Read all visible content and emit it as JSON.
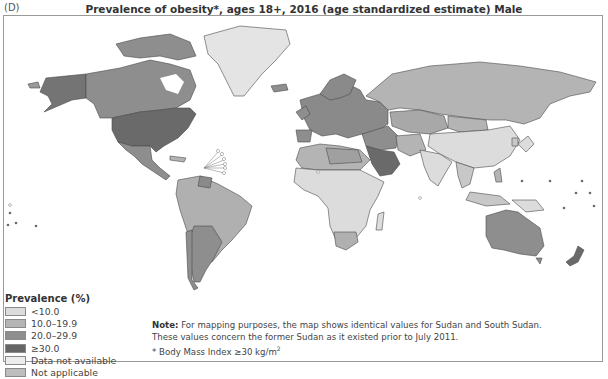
{
  "panel_label": "(D)",
  "title": "Prevalence of obesity*, ages 18+, 2016 (age standardized estimate) Male",
  "legend": {
    "title": "Prevalence (%)",
    "items": [
      {
        "label": "<10.0",
        "color": "#dcdcdc"
      },
      {
        "label": "10.0–19.9",
        "color": "#b4b4b4"
      },
      {
        "label": "20.0–29.9",
        "color": "#8e8e8e"
      },
      {
        "label": "≥30.0",
        "color": "#666666"
      },
      {
        "label": "Data not available",
        "color": "#ededed"
      },
      {
        "label": "Not applicable",
        "color": "#bdbdbd"
      }
    ]
  },
  "note": {
    "bold": "Note:",
    "line1": " For mapping purposes, the map shows identical values for Sudan and South Sudan.",
    "line2": "These values concern the former Sudan as it existed prior to July 2011.",
    "footnote_prefix": "* Body Mass Index ≥30 kg/m",
    "footnote_sup": "2"
  },
  "map_data": {
    "type": "choropleth",
    "metric": "Prevalence of obesity, male, ages 18+, 2016 (%)",
    "regions": [
      {
        "name": "United States",
        "class": "≥30.0"
      },
      {
        "name": "Canada",
        "class": "20.0–29.9"
      },
      {
        "name": "Alaska (US)",
        "class": "≥30.0"
      },
      {
        "name": "Greenland",
        "class": "Data not available"
      },
      {
        "name": "Mexico",
        "class": "20.0–29.9"
      },
      {
        "name": "South America (most)",
        "class": "10.0–19.9"
      },
      {
        "name": "Argentina/Chile",
        "class": "20.0–29.9"
      },
      {
        "name": "Europe",
        "class": "20.0–29.9"
      },
      {
        "name": "Russia",
        "class": "10.0–19.9"
      },
      {
        "name": "Saudi Arabia / Gulf",
        "class": "≥30.0"
      },
      {
        "name": "North Africa",
        "class": "10.0–19.9"
      },
      {
        "name": "Sub-Saharan Africa",
        "class": "<10.0"
      },
      {
        "name": "South Africa",
        "class": "10.0–19.9"
      },
      {
        "name": "China",
        "class": "<10.0"
      },
      {
        "name": "India",
        "class": "<10.0"
      },
      {
        "name": "Australia",
        "class": "20.0–29.9"
      },
      {
        "name": "New Zealand",
        "class": "≥30.0"
      }
    ]
  }
}
